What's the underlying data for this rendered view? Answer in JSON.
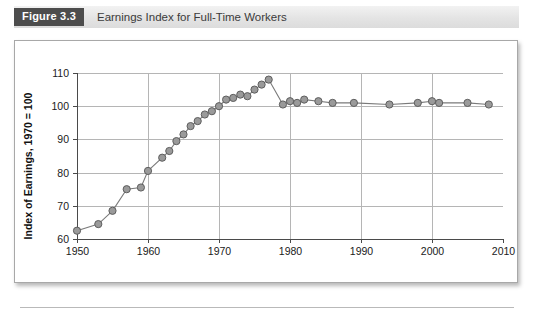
{
  "caption": {
    "figure_tag": "Figure 3.3",
    "title": "Earnings Index for Full-Time Workers"
  },
  "chart_data": {
    "type": "line",
    "title": "Earnings Index for Full-Time Workers",
    "xlabel": "",
    "ylabel": "Index of Earnings, 1970 = 100",
    "xlim": [
      1950,
      2010
    ],
    "ylim": [
      60,
      110
    ],
    "xticks": [
      1950,
      1960,
      1970,
      1980,
      1990,
      2000,
      2010
    ],
    "yticks": [
      60,
      70,
      80,
      90,
      100,
      110
    ],
    "grid": true,
    "legend": null,
    "marker": "circle",
    "series_color": "#9a9a9a",
    "line_color": "#7a7a7a",
    "x": [
      1950,
      1953,
      1955,
      1957,
      1959,
      1960,
      1962,
      1963,
      1964,
      1965,
      1966,
      1967,
      1968,
      1969,
      1970,
      1971,
      1972,
      1973,
      1974,
      1975,
      1976,
      1977,
      1979,
      1980,
      1981,
      1982,
      1984,
      1986,
      1989,
      1994,
      1998,
      2000,
      2001,
      2005,
      2008
    ],
    "values": [
      62.5,
      64.5,
      68.5,
      75.0,
      75.5,
      80.5,
      84.5,
      86.5,
      89.5,
      91.5,
      94.0,
      95.5,
      97.5,
      98.5,
      100.0,
      102.0,
      102.5,
      103.5,
      103.0,
      105.0,
      106.5,
      108.0,
      100.5,
      101.5,
      101.0,
      102.0,
      101.5,
      101.0,
      101.0,
      100.5,
      101.0,
      101.5,
      101.0,
      101.0,
      100.5
    ]
  },
  "axis_text": {
    "y_title": "Index of Earnings, 1970 = 100",
    "y_ticks": [
      "110",
      "100",
      "90",
      "80",
      "70",
      "60"
    ],
    "x_ticks": [
      "1950",
      "1960",
      "1970",
      "1980",
      "1990",
      "2000",
      "2010"
    ]
  }
}
